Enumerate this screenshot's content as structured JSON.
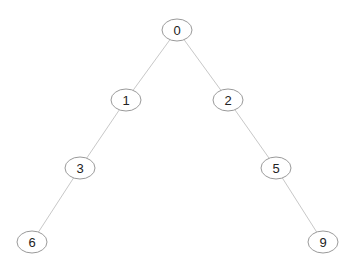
{
  "diagram": {
    "type": "binary-tree",
    "nodes": [
      {
        "id": "0",
        "label": "0",
        "x": 177,
        "y": 30
      },
      {
        "id": "1",
        "label": "1",
        "x": 126,
        "y": 100
      },
      {
        "id": "2",
        "label": "2",
        "x": 228,
        "y": 100
      },
      {
        "id": "3",
        "label": "3",
        "x": 80,
        "y": 168
      },
      {
        "id": "5",
        "label": "5",
        "x": 276,
        "y": 168
      },
      {
        "id": "6",
        "label": "6",
        "x": 32,
        "y": 242
      },
      {
        "id": "9",
        "label": "9",
        "x": 323,
        "y": 242
      }
    ],
    "edges": [
      [
        "0",
        "1"
      ],
      [
        "0",
        "2"
      ],
      [
        "1",
        "3"
      ],
      [
        "2",
        "5"
      ],
      [
        "3",
        "6"
      ],
      [
        "5",
        "9"
      ]
    ]
  }
}
